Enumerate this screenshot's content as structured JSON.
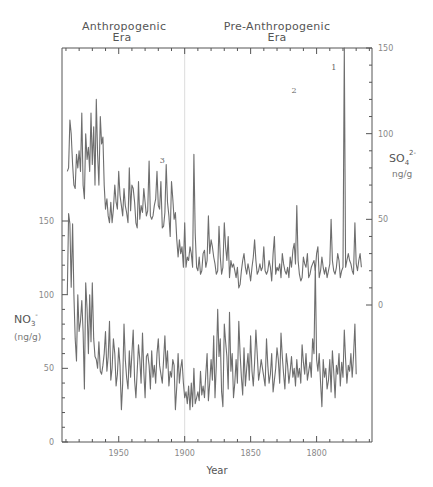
{
  "chart_data": {
    "type": "line",
    "title": "",
    "eras": [
      {
        "label_line1": "Anthropogenic",
        "label_line2": "Era"
      },
      {
        "label_line1": "Pre-Anthropogenic",
        "label_line2": "Era"
      }
    ],
    "xlabel": "Year",
    "x_reversed": true,
    "xlim": [
      1993,
      1758
    ],
    "x_ticks": [
      1950,
      1900,
      1850,
      1800
    ],
    "era_boundary_year": 1900,
    "left_axis": {
      "label": "NO3-",
      "label_sub": "3",
      "label_sup": "-",
      "label_base": "NO",
      "units": "(ng/g)",
      "ylim": [
        0,
        150
      ],
      "ticks": [
        0,
        50,
        100,
        150
      ]
    },
    "right_axis": {
      "label_base": "SO",
      "label_sub": "4",
      "label_sup": "2-",
      "units": "ng/g",
      "ylim": [
        0,
        150
      ],
      "ticks": [
        0,
        50,
        100,
        150
      ]
    },
    "annotations": [
      {
        "text": "1",
        "year": 1784,
        "so4": 137
      },
      {
        "text": "2",
        "year": 1814,
        "so4": 124
      },
      {
        "text": "3",
        "year": 1914,
        "so4": 83
      }
    ],
    "grid": false,
    "series": [
      {
        "name": "SO4 2- (ng/g)",
        "axis": "right",
        "color": "#6e6e6e",
        "years": [
          1989,
          1988,
          1987,
          1986,
          1985,
          1984,
          1983,
          1982,
          1981,
          1980,
          1979,
          1978,
          1977,
          1976,
          1975,
          1974,
          1973,
          1972,
          1971,
          1970,
          1969,
          1968,
          1967,
          1966,
          1965,
          1964,
          1963,
          1962,
          1961,
          1960,
          1959,
          1958,
          1957,
          1956,
          1955,
          1954,
          1953,
          1952,
          1951,
          1950,
          1949,
          1948,
          1947,
          1946,
          1945,
          1944,
          1943,
          1942,
          1941,
          1940,
          1939,
          1938,
          1937,
          1936,
          1935,
          1934,
          1933,
          1932,
          1931,
          1930,
          1929,
          1928,
          1927,
          1926,
          1925,
          1924,
          1923,
          1922,
          1921,
          1920,
          1919,
          1918,
          1917,
          1916,
          1915,
          1914,
          1913,
          1912,
          1911,
          1910,
          1909,
          1908,
          1907,
          1906,
          1905,
          1904,
          1903,
          1902,
          1901,
          1900,
          1899,
          1898,
          1897,
          1896,
          1895,
          1894,
          1893,
          1892,
          1891,
          1890,
          1889,
          1888,
          1887,
          1886,
          1885,
          1884,
          1883,
          1882,
          1881,
          1880,
          1879,
          1878,
          1877,
          1876,
          1875,
          1874,
          1873,
          1872,
          1871,
          1870,
          1869,
          1868,
          1867,
          1866,
          1865,
          1864,
          1863,
          1862,
          1861,
          1860,
          1859,
          1858,
          1857,
          1856,
          1855,
          1854,
          1853,
          1852,
          1851,
          1850,
          1849,
          1848,
          1847,
          1846,
          1845,
          1844,
          1843,
          1842,
          1841,
          1840,
          1839,
          1838,
          1837,
          1836,
          1835,
          1834,
          1833,
          1832,
          1831,
          1830,
          1829,
          1828,
          1827,
          1826,
          1825,
          1824,
          1823,
          1822,
          1821,
          1820,
          1819,
          1818,
          1817,
          1816,
          1815,
          1814,
          1813,
          1812,
          1811,
          1810,
          1809,
          1808,
          1807,
          1806,
          1805,
          1804,
          1803,
          1802,
          1801,
          1800,
          1799,
          1798,
          1797,
          1796,
          1795,
          1794,
          1793,
          1792,
          1791,
          1790,
          1789,
          1788,
          1787,
          1786,
          1785,
          1784,
          1783,
          1782,
          1781,
          1780,
          1779,
          1778,
          1777,
          1776,
          1775,
          1774,
          1773,
          1772,
          1771,
          1770,
          1769,
          1768,
          1767,
          1766
        ],
        "values": [
          78,
          80,
          108,
          100,
          82,
          70,
          68,
          88,
          80,
          90,
          78,
          112,
          70,
          62,
          100,
          85,
          92,
          78,
          112,
          82,
          104,
          70,
          120,
          88,
          70,
          110,
          94,
          98,
          70,
          56,
          62,
          52,
          48,
          60,
          48,
          56,
          70,
          60,
          56,
          78,
          64,
          58,
          52,
          68,
          58,
          54,
          48,
          80,
          55,
          70,
          68,
          60,
          48,
          45,
          72,
          50,
          58,
          54,
          68,
          60,
          52,
          55,
          84,
          52,
          50,
          52,
          58,
          62,
          78,
          58,
          56,
          72,
          45,
          46,
          54,
          82,
          60,
          52,
          40,
          72,
          62,
          50,
          54,
          38,
          28,
          38,
          30,
          34,
          22,
          48,
          22,
          28,
          26,
          34,
          30,
          22,
          88,
          42,
          22,
          20,
          28,
          18,
          20,
          30,
          32,
          22,
          26,
          52,
          30,
          38,
          34,
          28,
          24,
          18,
          20,
          46,
          28,
          18,
          22,
          48,
          34,
          26,
          40,
          16,
          26,
          22,
          24,
          20,
          16,
          22,
          10,
          12,
          20,
          26,
          30,
          22,
          18,
          24,
          20,
          14,
          22,
          28,
          38,
          26,
          18,
          20,
          24,
          20,
          22,
          34,
          20,
          18,
          20,
          26,
          22,
          14,
          30,
          40,
          18,
          22,
          20,
          24,
          16,
          30,
          24,
          20,
          18,
          22,
          16,
          28,
          22,
          32,
          36,
          24,
          58,
          26,
          18,
          14,
          16,
          28,
          24,
          22,
          30,
          16,
          18,
          22,
          24,
          26,
          20,
          30,
          34,
          16,
          20,
          28,
          22,
          18,
          22,
          16,
          20,
          24,
          50,
          26,
          20,
          18,
          22,
          30,
          26,
          16,
          20,
          22,
          152,
          22,
          26,
          30,
          26,
          24,
          20,
          18,
          48,
          24,
          20,
          26,
          30,
          22
        ],
        "notes": "Annual values estimated from plot; peaks labeled 1 (~1784, >150), 2 (~1815, ~127), 3 (~1914)."
      },
      {
        "name": "NO3- (ng/g)",
        "axis": "left",
        "color": "#6e6e6e",
        "years": [
          1989,
          1988,
          1987,
          1986,
          1985,
          1984,
          1983,
          1982,
          1981,
          1980,
          1979,
          1978,
          1977,
          1976,
          1975,
          1974,
          1973,
          1972,
          1971,
          1970,
          1969,
          1968,
          1967,
          1966,
          1965,
          1964,
          1963,
          1962,
          1961,
          1960,
          1959,
          1958,
          1957,
          1956,
          1955,
          1954,
          1953,
          1952,
          1951,
          1950,
          1949,
          1948,
          1947,
          1946,
          1945,
          1944,
          1943,
          1942,
          1941,
          1940,
          1939,
          1938,
          1937,
          1936,
          1935,
          1934,
          1933,
          1932,
          1931,
          1930,
          1929,
          1928,
          1927,
          1926,
          1925,
          1924,
          1923,
          1922,
          1921,
          1920,
          1919,
          1918,
          1917,
          1916,
          1915,
          1914,
          1913,
          1912,
          1911,
          1910,
          1909,
          1908,
          1907,
          1906,
          1905,
          1904,
          1903,
          1902,
          1901,
          1900,
          1899,
          1898,
          1897,
          1896,
          1895,
          1894,
          1893,
          1892,
          1891,
          1890,
          1889,
          1888,
          1887,
          1886,
          1885,
          1884,
          1883,
          1882,
          1881,
          1880,
          1879,
          1878,
          1877,
          1876,
          1875,
          1874,
          1873,
          1872,
          1871,
          1870,
          1869,
          1868,
          1867,
          1866,
          1865,
          1864,
          1863,
          1862,
          1861,
          1860,
          1859,
          1858,
          1857,
          1856,
          1855,
          1854,
          1853,
          1852,
          1851,
          1850,
          1849,
          1848,
          1847,
          1846,
          1845,
          1844,
          1843,
          1842,
          1841,
          1840,
          1839,
          1838,
          1837,
          1836,
          1835,
          1834,
          1833,
          1832,
          1831,
          1830,
          1829,
          1828,
          1827,
          1826,
          1825,
          1824,
          1823,
          1822,
          1821,
          1820,
          1819,
          1818,
          1817,
          1816,
          1815,
          1814,
          1813,
          1812,
          1811,
          1810,
          1809,
          1808,
          1807,
          1806,
          1805,
          1804,
          1803,
          1802,
          1801,
          1800,
          1799,
          1798,
          1797,
          1796,
          1795,
          1794,
          1793,
          1792,
          1791,
          1790,
          1789,
          1788,
          1787,
          1786,
          1785,
          1784,
          1783,
          1782,
          1781,
          1780,
          1779,
          1778,
          1777,
          1776,
          1775,
          1774,
          1773,
          1772,
          1771,
          1770,
          1769,
          1768,
          1767,
          1766
        ],
        "values": [
          100,
          155,
          148,
          105,
          148,
          100,
          70,
          55,
          100,
          75,
          82,
          96,
          75,
          36,
          108,
          90,
          60,
          100,
          68,
          108,
          70,
          58,
          56,
          50,
          68,
          48,
          46,
          52,
          60,
          75,
          48,
          58,
          82,
          42,
          50,
          70,
          60,
          38,
          46,
          64,
          52,
          22,
          40,
          80,
          56,
          44,
          36,
          62,
          44,
          60,
          76,
          42,
          30,
          48,
          66,
          56,
          40,
          74,
          48,
          30,
          58,
          60,
          52,
          36,
          62,
          44,
          52,
          40,
          60,
          70,
          52,
          46,
          40,
          56,
          72,
          50,
          62,
          38,
          48,
          44,
          56,
          52,
          22,
          38,
          60,
          40,
          50,
          56,
          40,
          30,
          34,
          26,
          38,
          22,
          40,
          24,
          50,
          26,
          30,
          34,
          28,
          48,
          32,
          38,
          30,
          46,
          60,
          28,
          40,
          56,
          42,
          72,
          30,
          52,
          90,
          58,
          70,
          34,
          24,
          80,
          68,
          58,
          36,
          88,
          48,
          60,
          30,
          40,
          56,
          40,
          82,
          60,
          44,
          32,
          64,
          38,
          50,
          60,
          42,
          72,
          48,
          38,
          54,
          76,
          60,
          42,
          48,
          56,
          50,
          44,
          38,
          70,
          52,
          40,
          46,
          60,
          34,
          42,
          50,
          64,
          56,
          40,
          74,
          58,
          46,
          36,
          60,
          52,
          40,
          48,
          58,
          44,
          50,
          38,
          56,
          44,
          50,
          40,
          66,
          54,
          46,
          60,
          42,
          48,
          54,
          44,
          70,
          60,
          120,
          56,
          48,
          60,
          40,
          24,
          56,
          44,
          50,
          36,
          42,
          56,
          34,
          62,
          48,
          30,
          52,
          46,
          60,
          38,
          54,
          44,
          76,
          56,
          40,
          52,
          48,
          60,
          44,
          58,
          80,
          46
        ],
        "notes": "Annual values estimated from plot; higher values (~100-155) in late 1980s, spike ~120 near 1800."
      }
    ]
  }
}
